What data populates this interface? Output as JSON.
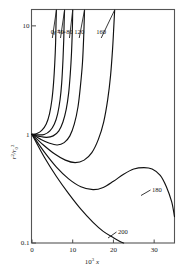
{
  "chart_data": {
    "type": "line",
    "title": "",
    "xlabel": "10³ x",
    "ylabel": "r²/r₀²",
    "xlim": [
      0,
      35
    ],
    "ylim": [
      0.1,
      14
    ],
    "yscale": "log",
    "xscale": "linear",
    "grid": false,
    "legend_position": "inline-top",
    "param_label": "γ⁺ =",
    "xticks": [
      "0",
      "10",
      "20",
      "30"
    ],
    "xtick_values": [
      0,
      10,
      20,
      30
    ],
    "yticks": [
      "10",
      "1",
      "0.1"
    ],
    "ytick_values": [
      10,
      1,
      0.1
    ],
    "series": [
      {
        "name": "0",
        "label": "0",
        "top_label": true,
        "points": [
          [
            0,
            1.0
          ],
          [
            1.2,
            1.02
          ],
          [
            2.4,
            1.09
          ],
          [
            3.5,
            1.25
          ],
          [
            4.3,
            1.55
          ],
          [
            4.9,
            2.1
          ],
          [
            5.3,
            3.0
          ],
          [
            5.6,
            4.6
          ],
          [
            5.8,
            7.0
          ],
          [
            5.9,
            10.5
          ],
          [
            6.0,
            14
          ]
        ]
      },
      {
        "name": "40",
        "label": "40",
        "top_label": true,
        "points": [
          [
            0,
            1.0
          ],
          [
            1.5,
            0.99
          ],
          [
            3.0,
            1.0
          ],
          [
            4.4,
            1.08
          ],
          [
            5.5,
            1.25
          ],
          [
            6.3,
            1.55
          ],
          [
            6.9,
            2.1
          ],
          [
            7.3,
            3.0
          ],
          [
            7.6,
            4.8
          ],
          [
            7.8,
            7.5
          ],
          [
            7.9,
            11
          ],
          [
            8.0,
            14
          ]
        ]
      },
      {
        "name": "80",
        "label": "80",
        "top_label": true,
        "points": [
          [
            0,
            1.0
          ],
          [
            1.8,
            0.96
          ],
          [
            3.6,
            0.94
          ],
          [
            5.2,
            0.97
          ],
          [
            6.6,
            1.08
          ],
          [
            7.6,
            1.3
          ],
          [
            8.4,
            1.7
          ],
          [
            9.0,
            2.4
          ],
          [
            9.4,
            3.6
          ],
          [
            9.7,
            5.6
          ],
          [
            9.9,
            9.0
          ],
          [
            10.0,
            14
          ]
        ]
      },
      {
        "name": "120",
        "label": "120",
        "top_label": true,
        "points": [
          [
            0,
            1.0
          ],
          [
            2.2,
            0.9
          ],
          [
            4.3,
            0.83
          ],
          [
            6.2,
            0.8
          ],
          [
            7.9,
            0.84
          ],
          [
            9.3,
            0.97
          ],
          [
            10.4,
            1.25
          ],
          [
            11.3,
            1.8
          ],
          [
            11.9,
            2.8
          ],
          [
            12.4,
            4.6
          ],
          [
            12.7,
            8.0
          ],
          [
            12.9,
            14
          ]
        ]
      },
      {
        "name": "160",
        "label": "160",
        "top_label": true,
        "points": [
          [
            0,
            1.0
          ],
          [
            2.8,
            0.8
          ],
          [
            5.6,
            0.66
          ],
          [
            8.2,
            0.58
          ],
          [
            10.6,
            0.55
          ],
          [
            12.8,
            0.58
          ],
          [
            14.7,
            0.68
          ],
          [
            16.3,
            0.9
          ],
          [
            17.6,
            1.3
          ],
          [
            18.6,
            2.1
          ],
          [
            19.3,
            3.5
          ],
          [
            19.8,
            6.2
          ],
          [
            20.1,
            10
          ],
          [
            20.3,
            14
          ]
        ]
      },
      {
        "name": "180",
        "label": "180",
        "top_label": false,
        "points": [
          [
            0,
            1.0
          ],
          [
            3.0,
            0.69
          ],
          [
            6.0,
            0.5
          ],
          [
            9.0,
            0.39
          ],
          [
            12.0,
            0.33
          ],
          [
            15.0,
            0.31
          ],
          [
            17.5,
            0.325
          ],
          [
            20.0,
            0.37
          ],
          [
            22.5,
            0.43
          ],
          [
            25.0,
            0.48
          ],
          [
            27.5,
            0.495
          ],
          [
            29.5,
            0.48
          ],
          [
            31.5,
            0.42
          ],
          [
            33.0,
            0.33
          ],
          [
            34.3,
            0.24
          ],
          [
            35.0,
            0.175
          ]
        ]
      },
      {
        "name": "200",
        "label": "200",
        "top_label": false,
        "points": [
          [
            0,
            1.0
          ],
          [
            3.0,
            0.62
          ],
          [
            6.0,
            0.41
          ],
          [
            9.0,
            0.285
          ],
          [
            12.0,
            0.205
          ],
          [
            15.0,
            0.155
          ],
          [
            17.5,
            0.128
          ],
          [
            20.0,
            0.112
          ],
          [
            21.5,
            0.104
          ],
          [
            22.5,
            0.099
          ]
        ]
      }
    ]
  },
  "labels": {
    "param": "γ⁺ =",
    "ylabel_main": "r",
    "ylabel_sup": "2",
    "ylabel_den": "/r",
    "ylabel_den_sub": "0",
    "xlabel_coef": "10",
    "xlabel_exp": "3",
    "xlabel_var": "x"
  }
}
